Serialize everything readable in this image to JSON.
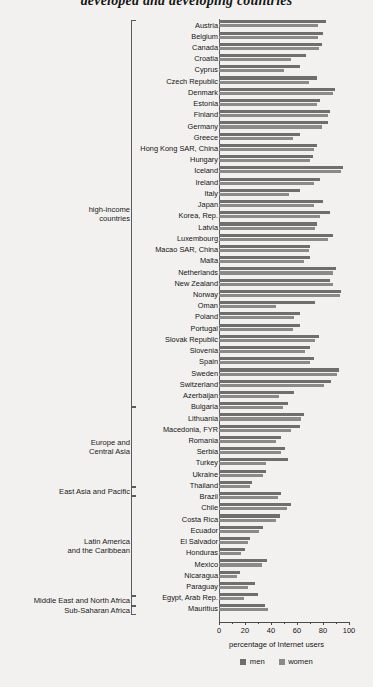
{
  "title": "developed and developing countries",
  "axis": {
    "xlabel": "percentage of Internet users",
    "ticks": [
      "0",
      "20",
      "40",
      "60",
      "80",
      "100"
    ],
    "xmin": 0,
    "xmax": 100
  },
  "legend": {
    "men_label": "men",
    "women_label": "women",
    "men_color": "#6e6e6e",
    "women_color": "#8a8a8a"
  },
  "groups": [
    {
      "name": "high-income countries",
      "lines": [
        "high-income",
        "countries"
      ],
      "start": 0,
      "end": 39
    },
    {
      "name": "Europe and Central Asia",
      "lines": [
        "Europe and",
        "Central Asia"
      ],
      "start": 39,
      "end": 47
    },
    {
      "name": "East Asia and Pacific",
      "lines": [
        "East Asia and Pacific"
      ],
      "start": 47,
      "end": 48
    },
    {
      "name": "Latin America and the Caribbean",
      "lines": [
        "Latin America",
        "and the Caribbean"
      ],
      "start": 48,
      "end": 58
    },
    {
      "name": "Middle East and North Africa",
      "lines": [
        "Middle East and North Africa"
      ],
      "start": 58,
      "end": 59
    },
    {
      "name": "Sub-Saharan Africa",
      "lines": [
        "Sub-Saharan Africa"
      ],
      "start": 59,
      "end": 60
    }
  ],
  "chart_data": {
    "type": "bar",
    "title": "developed and developing countries",
    "xlabel": "percentage of Internet users",
    "ylabel": "",
    "xlim": [
      0,
      100
    ],
    "grid": false,
    "orientation": "horizontal",
    "legend_position": "bottom",
    "categories": [
      "Austria",
      "Belgium",
      "Canada",
      "Croatia",
      "Cyprus",
      "Czech Republic",
      "Denmark",
      "Estonia",
      "Finland",
      "Germany",
      "Greece",
      "Hong Kong SAR, China",
      "Hungary",
      "Iceland",
      "Ireland",
      "Italy",
      "Japan",
      "Korea, Rep.",
      "Latvia",
      "Luxembourg",
      "Macao SAR, China",
      "Malta",
      "Netherlands",
      "New Zealand",
      "Norway",
      "Oman",
      "Poland",
      "Portugal",
      "Slovak Republic",
      "Slovenia",
      "Spain",
      "Sweden",
      "Switzerland",
      "Azerbaijan",
      "Bulgaria",
      "Lithuania",
      "Macedonia, FYR",
      "Romania",
      "Serbia",
      "Turkey",
      "Ukraine",
      "Thailand",
      "Brazil",
      "Chile",
      "Costa Rica",
      "Ecuador",
      "El Salvador",
      "Honduras",
      "Mexico",
      "Nicaragua",
      "Paraguay",
      "Egypt, Arab Rep.",
      "Mauritius"
    ],
    "series": [
      {
        "name": "men",
        "color": "#6e6e6e",
        "values": [
          82,
          80,
          79,
          67,
          62,
          75,
          89,
          78,
          85,
          84,
          62,
          75,
          72,
          95,
          78,
          62,
          80,
          85,
          75,
          88,
          70,
          70,
          90,
          85,
          94,
          74,
          62,
          62,
          77,
          70,
          73,
          92,
          86,
          58,
          53,
          65,
          62,
          48,
          51,
          53,
          36,
          25,
          48,
          55,
          47,
          34,
          24,
          20,
          37,
          16,
          28,
          30,
          35
        ]
      },
      {
        "name": "women",
        "color": "#8a8a8a",
        "values": [
          76,
          76,
          77,
          55,
          50,
          69,
          88,
          75,
          84,
          79,
          57,
          73,
          70,
          94,
          73,
          54,
          73,
          78,
          74,
          84,
          69,
          65,
          88,
          88,
          93,
          44,
          58,
          57,
          74,
          66,
          70,
          91,
          81,
          46,
          49,
          63,
          55,
          44,
          48,
          36,
          34,
          24,
          45,
          52,
          44,
          31,
          22,
          17,
          33,
          14,
          22,
          19,
          38
        ]
      }
    ]
  }
}
